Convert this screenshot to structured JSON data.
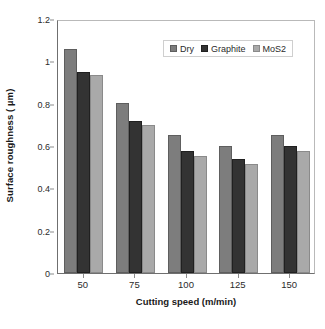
{
  "chart_data": {
    "type": "bar",
    "title": "",
    "xlabel": "Cutting speed (m/min)",
    "ylabel": "Surface roughness ( µm)",
    "categories": [
      "50",
      "75",
      "100",
      "125",
      "150"
    ],
    "series": [
      {
        "name": "Dry",
        "color": "#7d7d7d",
        "values": [
          1.06,
          0.805,
          0.65,
          0.6,
          0.65
        ]
      },
      {
        "name": "Graphite",
        "color": "#333333",
        "values": [
          0.95,
          0.72,
          0.575,
          0.54,
          0.6
        ]
      },
      {
        "name": "MoS2",
        "color": "#a9a9a9",
        "values": [
          0.935,
          0.7,
          0.555,
          0.515,
          0.575
        ]
      }
    ],
    "ylim": [
      0,
      1.2
    ],
    "yticks": [
      "0",
      "0.2",
      "0.4",
      "0.6",
      "0.8",
      "1",
      "1.2"
    ],
    "ytick_values": [
      0,
      0.2,
      0.4,
      0.6,
      0.8,
      1,
      1.2
    ],
    "grid": false,
    "legend_position": "top-right-inside"
  },
  "axes": {
    "y_title": "Surface roughness ( µm)",
    "x_title": "Cutting speed (m/min)"
  },
  "legend": {
    "entries": [
      {
        "label": "Dry"
      },
      {
        "label": "Graphite"
      },
      {
        "label": "MoS2"
      }
    ]
  },
  "caption": {
    "text": ""
  }
}
